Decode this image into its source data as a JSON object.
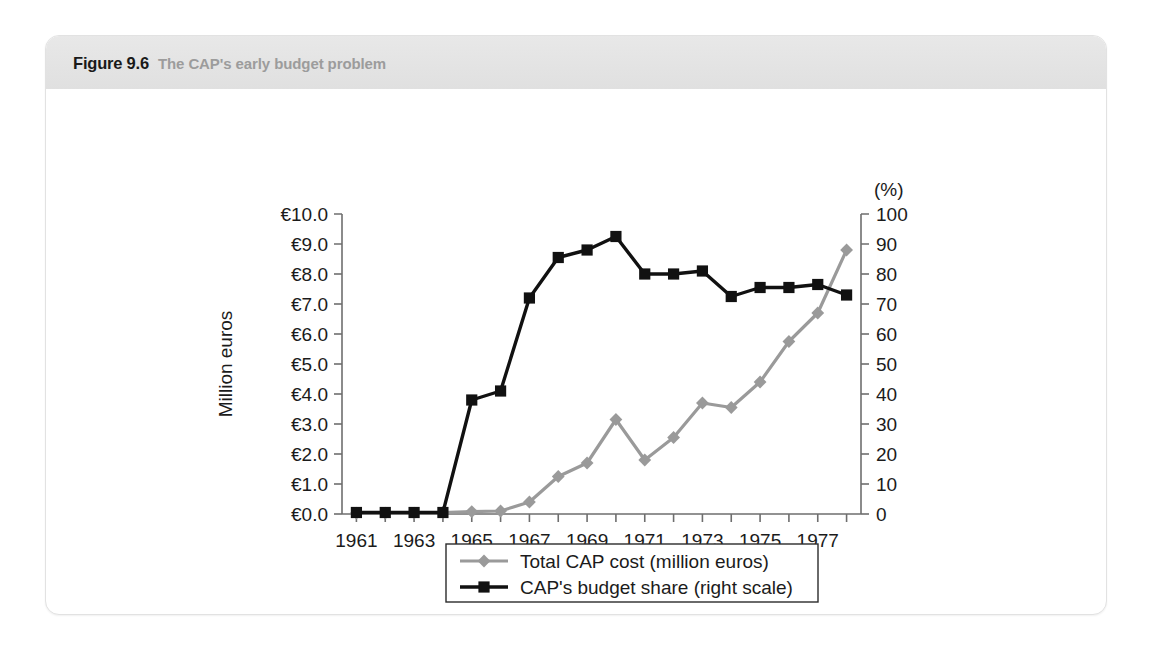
{
  "figure": {
    "number": "Figure 9.6",
    "caption": "The CAP's early budget problem"
  },
  "chart_data": {
    "type": "line",
    "title": "The CAP's early budget problem",
    "xlabel": "",
    "ylabel": "Million euros",
    "y2label": "(%)",
    "x": [
      1961,
      1962,
      1963,
      1964,
      1965,
      1966,
      1967,
      1968,
      1969,
      1970,
      1971,
      1972,
      1973,
      1974,
      1975,
      1976,
      1977,
      1978
    ],
    "xlim": [
      1960.5,
      1978.5
    ],
    "xtick_labels": [
      "1961",
      "1963",
      "1965",
      "1967",
      "1969",
      "1971",
      "1973",
      "1975",
      "1977"
    ],
    "xtick_values": [
      1961,
      1963,
      1965,
      1967,
      1969,
      1971,
      1973,
      1975,
      1977
    ],
    "ylim": [
      0,
      10
    ],
    "ytick_labels": [
      "€0.0",
      "€1.0",
      "€2.0",
      "€3.0",
      "€4.0",
      "€5.0",
      "€6.0",
      "€7.0",
      "€8.0",
      "€9.0",
      "€10.0"
    ],
    "ytick_values": [
      0,
      1,
      2,
      3,
      4,
      5,
      6,
      7,
      8,
      9,
      10
    ],
    "y2lim": [
      0,
      100
    ],
    "y2tick_labels": [
      "0",
      "10",
      "20",
      "30",
      "40",
      "50",
      "60",
      "70",
      "80",
      "90",
      "100"
    ],
    "y2tick_values": [
      0,
      10,
      20,
      30,
      40,
      50,
      60,
      70,
      80,
      90,
      100
    ],
    "grid": false,
    "legend_position": "bottom-center",
    "series": [
      {
        "name": "Total CAP cost (million euros)",
        "axis": "left",
        "marker": "diamond",
        "color": "#9a9a9a",
        "values": [
          0.03,
          0.03,
          0.03,
          0.05,
          0.08,
          0.1,
          0.4,
          1.25,
          1.7,
          3.15,
          1.8,
          2.55,
          3.7,
          3.55,
          4.4,
          5.75,
          6.7,
          8.8
        ]
      },
      {
        "name": "CAP's budget share (right scale)",
        "axis": "right",
        "marker": "square",
        "color": "#111111",
        "values": [
          0.5,
          0.5,
          0.5,
          0.5,
          38.0,
          41.0,
          72.0,
          85.5,
          88.0,
          92.5,
          80.0,
          80.0,
          81.0,
          72.5,
          75.5,
          75.5,
          76.5,
          73.0
        ]
      }
    ]
  }
}
